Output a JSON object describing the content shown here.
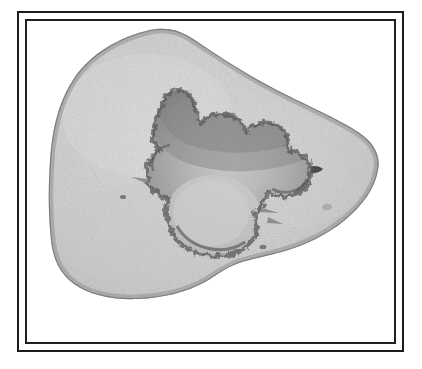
{
  "plate": {
    "title": "",
    "caption": "",
    "background_color": "#ffffff",
    "width": 422,
    "height": 369
  },
  "frame": {
    "style": "double-rule",
    "outer_color": "#1c1c1c",
    "inner_color": "#1f1f1f",
    "outer_thickness_px": 2,
    "inner_thickness_px": 2,
    "gap_px": 6,
    "outer_label": "",
    "inner_label": ""
  },
  "photograph": {
    "subject": "stone-specimen",
    "description": "",
    "mode": "grayscale",
    "scale_bar": "",
    "label": "",
    "background_color": "#ffffff"
  },
  "specimen": {
    "name": "stone-specimen",
    "form": "rounded-triangular-cobble",
    "body_color_light": "#d9d9d9",
    "body_color_mid": "#c6c6c6",
    "body_color_dark": "#ababab",
    "edge_shadow_color": "#8e8e8e",
    "speckle_color": "#4a4a4a",
    "depression": {
      "name": "central-depression",
      "form": "irregular-lobed-hollow",
      "rim_color": "#7d7d7d",
      "rim_dark_color": "#5c5c5c",
      "floor_color": "#c2c2c2",
      "floor_highlight": "#cfcfcf"
    },
    "pit": {
      "name": "small-pit",
      "color": "#3f3f3f"
    }
  }
}
